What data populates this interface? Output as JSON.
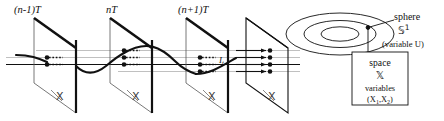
{
  "figure": {
    "background_color": "#ffffff",
    "ink_color": "#111111",
    "guide_color": "#9a9a9a",
    "width": 444,
    "height": 121
  },
  "time_labels": [
    {
      "name": "t-prev",
      "text": "(n-1)T",
      "x": 30,
      "y": 12
    },
    {
      "name": "t-cur",
      "text": "nT",
      "x": 112,
      "y": 12
    },
    {
      "name": "t-next",
      "text": "(n+1)T",
      "x": 178,
      "y": 12
    }
  ],
  "planes": [
    {
      "name": "plane-n-minus-1",
      "glyph": "ᵔ̲",
      "label": "X",
      "dots": 2,
      "x": 30
    },
    {
      "name": "plane-n",
      "glyph": "X",
      "label": "X",
      "dots": 3,
      "x": 112
    },
    {
      "name": "plane-n-plus-1",
      "glyph": "X",
      "label": "X",
      "dots": 3,
      "x": 194
    },
    {
      "name": "plane-final",
      "glyph": "X",
      "label": "X",
      "dots": 4,
      "x": 268
    }
  ],
  "current_label": {
    "name": "current-arrow-label",
    "text": "I",
    "subscript": "t"
  },
  "sphere": {
    "name": "sphere-annotation",
    "line1": "sphere",
    "line2_glyph": "𝕊",
    "line2_superscript": "1",
    "line3": "(variable U)",
    "ring_count": 3
  },
  "space_box": {
    "name": "space-annotation-box",
    "line1": "space",
    "line2_glyph": "𝕏",
    "line3": "variables",
    "line4": "(X",
    "line4_sub1": "1",
    "line4_mid": ",X",
    "line4_sub2": "2",
    "line4_end": ")"
  }
}
